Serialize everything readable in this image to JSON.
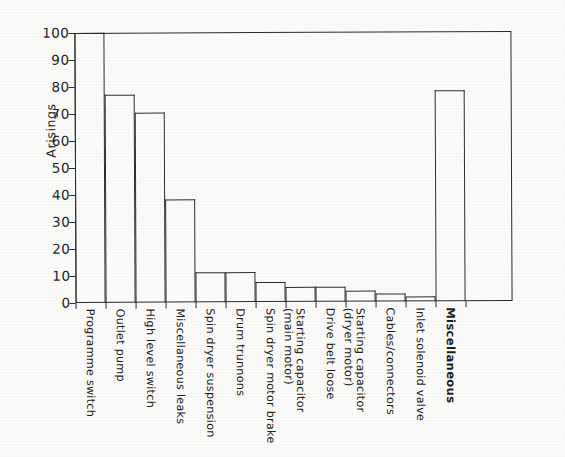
{
  "figure": {
    "background_color": "#ffffff",
    "ink_color": "#2b2b2b"
  },
  "axes": {
    "y_axis_title": "Arisings",
    "y_ticks": [
      "0",
      "10",
      "20",
      "30",
      "40",
      "50",
      "60",
      "70",
      "80",
      "90",
      "100"
    ],
    "y_min": 0,
    "y_max": 100,
    "x_axis_title": ""
  },
  "chart_data": {
    "type": "bar",
    "title": "",
    "subtitle": "",
    "xlabel": "",
    "ylabel": "Arisings",
    "ylim": [
      0,
      100
    ],
    "yticks": [
      0,
      10,
      20,
      30,
      40,
      50,
      60,
      70,
      80,
      90,
      100
    ],
    "grid": false,
    "legend": false,
    "bar_style": "outlined, unfilled, adjacent (histogram-style)",
    "categories": [
      "Programme switch",
      "Outlet pump",
      "High level switch",
      "Miscellaneous leaks",
      "Spin dryer suspension",
      "Drum trunnons",
      "Spin dryer motor brake",
      "Starting capacitor (main motor)",
      "Drive belt loose",
      "Starting capacitor (dryer motor)",
      "Cables/connectors",
      "Inlet solenoid valve",
      "Miscellaneous"
    ],
    "values": [
      100,
      77,
      70.5,
      38,
      11,
      11,
      7.5,
      5.5,
      5.5,
      4,
      3,
      2,
      78
    ]
  },
  "category_labels": [
    {
      "line1": "Programme switch",
      "line2": "",
      "bold": false
    },
    {
      "line1": "Outlet pump",
      "line2": "",
      "bold": false
    },
    {
      "line1": "High level switch",
      "line2": "",
      "bold": false
    },
    {
      "line1": "Miscellaneous leaks",
      "line2": "",
      "bold": false
    },
    {
      "line1": "Spin dryer suspension",
      "line2": "",
      "bold": false
    },
    {
      "line1": "Drum trunnons",
      "line2": "",
      "bold": false
    },
    {
      "line1": "Spin dryer motor brake",
      "line2": "",
      "bold": false
    },
    {
      "line1": "Starting capacitor",
      "line2": "(main motor)",
      "bold": false
    },
    {
      "line1": "Drive belt loose",
      "line2": "",
      "bold": false
    },
    {
      "line1": "Starting capacitor",
      "line2": "(dryer motor)",
      "bold": false
    },
    {
      "line1": "Cables/connectors",
      "line2": "",
      "bold": false
    },
    {
      "line1": "Inlet solenoid valve",
      "line2": "",
      "bold": false
    },
    {
      "line1": "Miscellaneous",
      "line2": "",
      "bold": true
    }
  ]
}
